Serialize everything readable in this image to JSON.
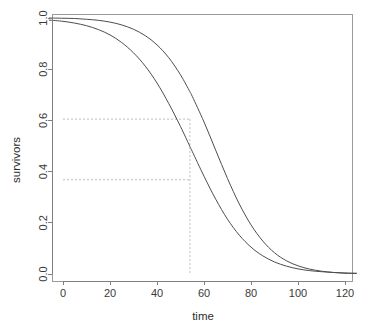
{
  "chart_data": {
    "type": "line",
    "title": "",
    "subtitle": "",
    "xlabel": "time",
    "ylabel": "survivors",
    "xlim": [
      -6,
      125
    ],
    "ylim": [
      0.0,
      1.0
    ],
    "grid": false,
    "legend": "none",
    "background": "#ffffff",
    "curve_color": "#4d4d4d",
    "reference_color": "#bdbdbd",
    "axis_color": "#808080",
    "x_ticks": [
      0,
      20,
      40,
      60,
      80,
      100,
      120
    ],
    "x_tick_labels": [
      "0",
      "20",
      "40",
      "60",
      "80",
      "100",
      "120"
    ],
    "y_ticks": [
      0.0,
      0.2,
      0.4,
      0.6,
      0.8,
      1.0
    ],
    "y_tick_labels": [
      "0.0",
      "0.2",
      "0.4",
      "0.6",
      "0.8",
      "1.0"
    ],
    "annotations": {
      "vertical_reference_x": 54,
      "horizontal_reference_upper_y": 0.605,
      "horizontal_reference_lower_y": 0.368
    },
    "series": [
      {
        "name": "survivors-curve-upper",
        "style": "solid",
        "x": [
          -6,
          0,
          5,
          10,
          15,
          20,
          25,
          30,
          35,
          40,
          45,
          50,
          54,
          55,
          60,
          65,
          70,
          75,
          80,
          85,
          90,
          95,
          100,
          105,
          110,
          115,
          120,
          125
        ],
        "y": [
          1.0,
          0.999,
          0.998,
          0.995,
          0.991,
          0.984,
          0.973,
          0.956,
          0.931,
          0.895,
          0.845,
          0.778,
          0.712,
          0.694,
          0.594,
          0.483,
          0.373,
          0.274,
          0.192,
          0.129,
          0.083,
          0.052,
          0.032,
          0.019,
          0.011,
          0.006,
          0.003,
          0.002
        ]
      },
      {
        "name": "survivors-curve-lower",
        "style": "solid",
        "x": [
          -6,
          0,
          5,
          10,
          15,
          20,
          25,
          30,
          35,
          40,
          45,
          50,
          54,
          55,
          60,
          65,
          70,
          75,
          80,
          85,
          90,
          95,
          100,
          105,
          110,
          115,
          120,
          125
        ],
        "y": [
          0.992,
          0.987,
          0.98,
          0.97,
          0.955,
          0.934,
          0.904,
          0.864,
          0.812,
          0.746,
          0.666,
          0.576,
          0.498,
          0.479,
          0.382,
          0.292,
          0.214,
          0.152,
          0.105,
          0.071,
          0.047,
          0.031,
          0.02,
          0.013,
          0.009,
          0.006,
          0.004,
          0.003
        ]
      }
    ]
  },
  "axes": {
    "x_title": "time",
    "y_title": "survivors"
  }
}
